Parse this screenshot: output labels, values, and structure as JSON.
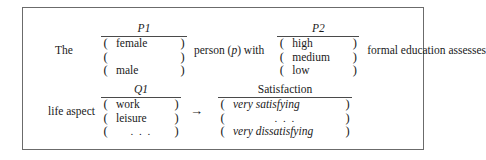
{
  "figure": {
    "border_color": "#6b6b6b",
    "rule_color": "#4a4a4a",
    "background": "#ffffff"
  },
  "top_row": {
    "lead_text": "The",
    "middle_text_before_var": "person (",
    "middle_var": "p",
    "middle_text_after_var": ") with",
    "tail_text": "formal education assesses",
    "p1": {
      "header": "P1",
      "header_style": "italic",
      "open_paren": "(",
      "close_paren": ")",
      "options": [
        "female",
        "",
        "male"
      ]
    },
    "p2": {
      "header": "P2",
      "header_style": "italic",
      "open_paren": "(",
      "close_paren": ")",
      "options": [
        "high",
        "medium",
        "low"
      ]
    }
  },
  "bottom_row": {
    "lead_text": "life aspect",
    "arrow": "→",
    "q1": {
      "header": "Q1",
      "header_style": "italic",
      "open_paren": "(",
      "close_paren": ")",
      "options": [
        "work",
        "leisure",
        ". . ."
      ]
    },
    "satisfaction": {
      "header": "Satisfaction",
      "header_style": "upright",
      "open_paren": "(",
      "close_paren": ")",
      "options": [
        "very satisfying",
        ". . .",
        "very dissatisfying"
      ]
    }
  }
}
